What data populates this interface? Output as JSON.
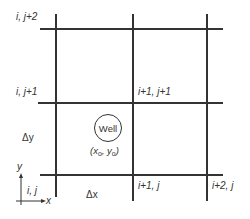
{
  "diagram": {
    "node_labels": {
      "i_j2": "i, j+2",
      "i_j1": "i, j+1",
      "i1_j1": "i+1, j+1",
      "i_j": "i, j",
      "i1_j": "i+1, j",
      "i2_j": "i+2, j"
    },
    "spacing_labels": {
      "dx": "Δx",
      "dy": "Δy"
    },
    "well": {
      "label": "Well",
      "coord_open": "(x",
      "coord_x_sub": "o",
      "coord_sep": ", y",
      "coord_y_sub": "o",
      "coord_close": ")"
    },
    "axes": {
      "x": "x",
      "y": "y"
    },
    "colors": {
      "line": "#333333",
      "background": "#ffffff"
    }
  }
}
